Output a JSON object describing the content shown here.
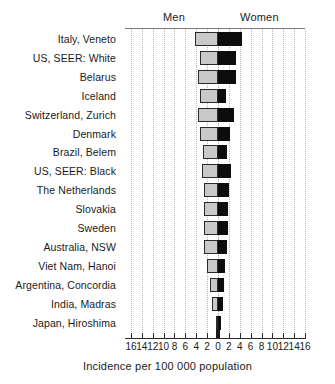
{
  "chart_data": {
    "type": "bar",
    "orientation": "horizontal-diverging",
    "title": "",
    "xlabel": "Incidence per 100 000 population",
    "ylabel": "",
    "xlim": [
      -16,
      16
    ],
    "grid": true,
    "legend_position": "top",
    "axis_tick_labels": [
      "16",
      "14",
      "12",
      "10",
      "8",
      "6",
      "4",
      "2",
      "0",
      "2",
      "4",
      "6",
      "8",
      "10",
      "12",
      "14",
      "16"
    ],
    "axis_tick_values": [
      -16,
      -14,
      -12,
      -10,
      -8,
      -6,
      -4,
      -2,
      0,
      2,
      4,
      6,
      8,
      10,
      12,
      14,
      16
    ],
    "group_labels": {
      "left": "Men",
      "right": "Women"
    },
    "categories": [
      "Italy, Veneto",
      "US, SEER:  White",
      "Belarus",
      "Iceland",
      "Switzerland, Zurich",
      "Denmark",
      "Brazil, Belem",
      "US, SEER: Black",
      "The Netherlands",
      "Slovakia",
      "Sweden",
      "Australia, NSW",
      "Viet Nam, Hanoi",
      "Argentina, Concordia",
      "India, Madras",
      "Japan, Hiroshima"
    ],
    "series": [
      {
        "name": "Men",
        "color": "#c9c9c9",
        "direction": "left",
        "values": [
          4.2,
          3.3,
          3.6,
          3.3,
          3.7,
          3.3,
          2.7,
          2.9,
          2.6,
          2.6,
          2.6,
          2.6,
          2.0,
          1.5,
          1.1,
          0.3
        ]
      },
      {
        "name": "Women",
        "color": "#0d0d0d",
        "direction": "right",
        "values": [
          4.5,
          3.3,
          3.3,
          1.5,
          2.9,
          2.2,
          1.7,
          2.4,
          2.0,
          1.8,
          1.8,
          1.7,
          1.3,
          1.1,
          0.9,
          0.5
        ]
      }
    ]
  }
}
